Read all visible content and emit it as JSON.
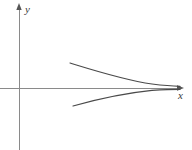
{
  "figure": {
    "title": "",
    "background_color": "#ffffff",
    "axis_color": "#8a8a8a",
    "curve_color": "#4a4a4a",
    "label_color": "#3a3a3a"
  },
  "axes": {
    "origin": {
      "x": 19,
      "y": 88
    },
    "y_axis": {
      "label": "y",
      "label_pos": {
        "x": 25,
        "y": 13
      },
      "line": {
        "x1": 19,
        "y1": 6,
        "x2": 19,
        "y2": 150
      },
      "arrow_tip": {
        "x": 19,
        "y": 4
      },
      "arrow_direction": "up"
    },
    "x_axis": {
      "label": "x",
      "label_pos": {
        "x": 178,
        "y": 99
      },
      "line": {
        "x1": 0,
        "y1": 88,
        "x2": 181,
        "y2": 88
      },
      "arrow_tip": {
        "x": 184,
        "y": 88
      },
      "arrow_direction": "right"
    }
  },
  "chart_data": {
    "type": "line",
    "title": "",
    "xlabel": "x",
    "ylabel": "y",
    "grid": false,
    "legend": null,
    "axis_ranges": {
      "xlim": [
        0,
        192
      ],
      "ylim": [
        0,
        150
      ]
    },
    "series": [
      {
        "name": "upper-branch",
        "path": "M 70 63 C 96 71, 124 80, 152 84 C 165 85.6, 174 86.2, 180 86.4",
        "points": [
          {
            "x": 70,
            "y": 63
          },
          {
            "x": 90,
            "y": 70
          },
          {
            "x": 110,
            "y": 76
          },
          {
            "x": 130,
            "y": 81
          },
          {
            "x": 150,
            "y": 84
          },
          {
            "x": 165,
            "y": 85.6
          },
          {
            "x": 180,
            "y": 86.4
          }
        ]
      },
      {
        "name": "lower-branch",
        "path": "M 73 106 C 98 99, 126 93, 152 90.4 C 165 89.6, 174 89.4, 180 89.4",
        "points": [
          {
            "x": 73,
            "y": 106
          },
          {
            "x": 92,
            "y": 100
          },
          {
            "x": 112,
            "y": 95.5
          },
          {
            "x": 132,
            "y": 92.4
          },
          {
            "x": 152,
            "y": 90.4
          },
          {
            "x": 166,
            "y": 89.7
          },
          {
            "x": 180,
            "y": 89.4
          }
        ]
      }
    ]
  }
}
